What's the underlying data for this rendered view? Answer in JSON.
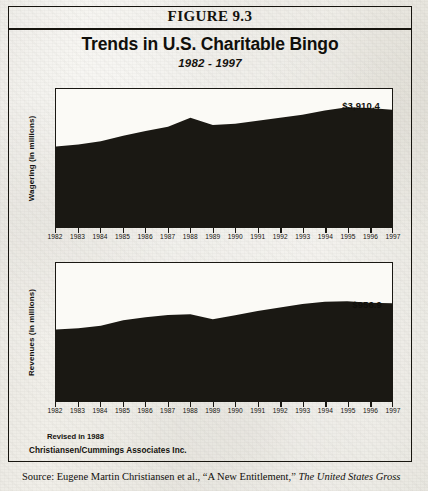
{
  "figure": {
    "header": "FIGURE 9.3",
    "title": "Trends in U.S. Charitable Bingo",
    "subtitle": "1982 - 1997"
  },
  "notes": {
    "revised": "Revised in 1988",
    "organization": "Christiansen/Cummings Associates Inc."
  },
  "citation": {
    "lead": "Source: Eugene Martin Christiansen et al., “A New Entitlement,” ",
    "italic": "The United States Gross"
  },
  "colors": {
    "area_fill": "#1a1813",
    "frame": "#17150f",
    "paper": "#ebe9e3"
  },
  "chart_data": [
    {
      "type": "area",
      "title": "Wagering",
      "ylabel": "Wagering (in millions)",
      "xlabel": "",
      "end_value_label": "$3,910.4",
      "grid": false,
      "legend": "none",
      "xlim": [
        1982,
        1997
      ],
      "ylim": [
        0,
        4600
      ],
      "categories": [
        1982,
        1983,
        1984,
        1985,
        1986,
        1987,
        1988,
        1989,
        1990,
        1991,
        1992,
        1993,
        1994,
        1995,
        1996,
        1997
      ],
      "tick_labels": [
        "1982",
        "1983",
        "1984",
        "1985",
        "1986",
        "1987",
        "1988",
        "1989",
        "1990",
        "1991",
        "1992",
        "1993",
        "1994",
        "1995",
        "1996",
        "1997"
      ],
      "values": [
        2680,
        2750,
        2860,
        3040,
        3200,
        3340,
        3640,
        3400,
        3440,
        3540,
        3640,
        3740,
        3880,
        3990,
        3970,
        3910.4
      ]
    },
    {
      "type": "area",
      "title": "Revenues",
      "ylabel": "Revenues (in millions)",
      "xlabel": "",
      "end_value_label": "$956.9",
      "grid": false,
      "legend": "none",
      "xlim": [
        1982,
        1997
      ],
      "ylim": [
        0,
        1350
      ],
      "categories": [
        1982,
        1983,
        1984,
        1985,
        1986,
        1987,
        1988,
        1989,
        1990,
        1991,
        1992,
        1993,
        1994,
        1995,
        1996,
        1997
      ],
      "tick_labels": [
        "1982",
        "1983",
        "1984",
        "1985",
        "1986",
        "1987",
        "1988",
        "1989",
        "1990",
        "1991",
        "1992",
        "1993",
        "1994",
        "1995",
        "1996",
        "1997"
      ],
      "values": [
        700,
        712,
        735,
        790,
        820,
        842,
        848,
        800,
        838,
        880,
        915,
        950,
        972,
        975,
        962,
        956.9
      ]
    }
  ]
}
